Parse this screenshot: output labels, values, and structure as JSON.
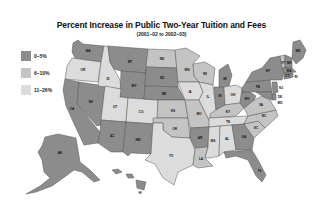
{
  "title": "Percent Increase in Public Two-Year Tuition and Fees",
  "subtitle": "(2001–02 to 2002–03)",
  "legend": [
    {
      "label": "0–5%",
      "color": "#8c8c8c"
    },
    {
      "label": "6–10%",
      "color": "#c4c4c4"
    },
    {
      "label": "11–26%",
      "color": "#dcdcdc"
    }
  ],
  "states": {
    "WA": {
      "label": "WA",
      "category": 0
    },
    "OR": {
      "label": "OR",
      "category": 2
    },
    "CA": {
      "label": "CA",
      "category": 0
    },
    "NV": {
      "label": "NV",
      "category": 0
    },
    "ID": {
      "label": "ID",
      "category": 2
    },
    "MT": {
      "label": "MT",
      "category": 0
    },
    "WY": {
      "label": "WY",
      "category": 0
    },
    "UT": {
      "label": "UT",
      "category": 2
    },
    "AZ": {
      "label": "AZ",
      "category": 0
    },
    "CO": {
      "label": "CO",
      "category": 2
    },
    "NM": {
      "label": "NM",
      "category": 0
    },
    "ND": {
      "label": "ND",
      "category": 1
    },
    "SD": {
      "label": "SD",
      "category": 0
    },
    "NE": {
      "label": "NE",
      "category": 0
    },
    "KS": {
      "label": "KS",
      "category": 1
    },
    "OK": {
      "label": "OK",
      "category": 1
    },
    "TX": {
      "label": "TX",
      "category": 2
    },
    "MN": {
      "label": "MN",
      "category": 1
    },
    "IA": {
      "label": "IA",
      "category": 2
    },
    "MO": {
      "label": "MO",
      "category": 1
    },
    "AR": {
      "label": "AR",
      "category": 0
    },
    "LA": {
      "label": "LA",
      "category": 1
    },
    "WI": {
      "label": "WI",
      "category": 1
    },
    "IL": {
      "label": "IL",
      "category": 2
    },
    "MI": {
      "label": "MI",
      "category": 0
    },
    "IN": {
      "label": "IN",
      "category": 0
    },
    "OH": {
      "label": "OH",
      "category": 2
    },
    "KY": {
      "label": "KY",
      "category": 1
    },
    "TN": {
      "label": "TN",
      "category": 2
    },
    "MS": {
      "label": "MS",
      "category": 2
    },
    "AL": {
      "label": "AL",
      "category": 2
    },
    "GA": {
      "label": "GA",
      "category": 0
    },
    "FL": {
      "label": "FL",
      "category": 0
    },
    "SC": {
      "label": "SC",
      "category": 1
    },
    "NC": {
      "label": "NC",
      "category": 1
    },
    "VA": {
      "label": "VA",
      "category": 1
    },
    "WV": {
      "label": "WV",
      "category": 0
    },
    "PA": {
      "label": "PA",
      "category": 0
    },
    "NY": {
      "label": "NY",
      "category": 0
    },
    "ME": {
      "label": "ME",
      "category": 0
    },
    "VT": {
      "label": "VT",
      "category": 1
    },
    "NH": {
      "label": "NH",
      "category": 0
    },
    "MA": {
      "label": "MA",
      "category": 0
    },
    "CT": {
      "label": "CT",
      "category": 0
    },
    "RI": {
      "label": "RI",
      "category": 0
    },
    "NJ": {
      "label": "NJ",
      "category": 0
    },
    "DE": {
      "label": "DE",
      "category": 0
    },
    "MD": {
      "label": "MD",
      "category": 0
    },
    "AK": {
      "label": "AK",
      "category": 0
    },
    "HI": {
      "label": "HI",
      "category": 0
    }
  }
}
